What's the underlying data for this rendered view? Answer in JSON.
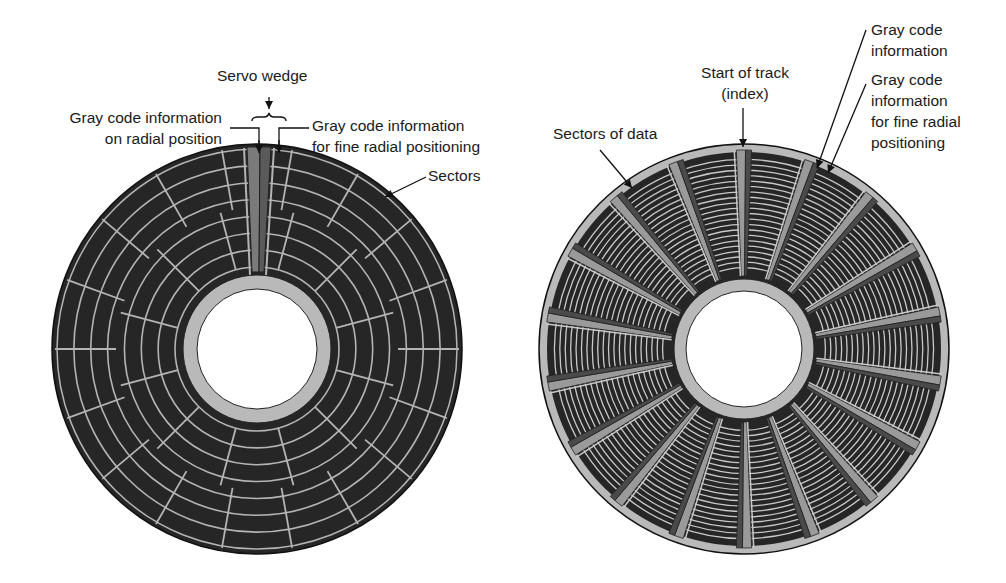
{
  "left_figure": {
    "title": "Servo wedge",
    "labels": {
      "servo_wedge": "Servo wedge",
      "gray_radial_1": "Gray code information",
      "gray_radial_2": "on radial position",
      "gray_fine_1": "Gray code information",
      "gray_fine_2": "for fine radial positioning",
      "sectors": "Sectors"
    },
    "disc": {
      "cx": 257,
      "cy": 349,
      "r_outer": 205,
      "r_hub": 74,
      "r_hole": 60,
      "tracks": 7,
      "sector_boundaries_per_zone": [
        24,
        12
      ]
    }
  },
  "right_figure": {
    "labels": {
      "start_track_1": "Start of track",
      "start_track_2": "(index)",
      "sectors_of_data": "Sectors of data",
      "gray_info_1": "Gray code",
      "gray_info_2": "information",
      "gray_fine_1": "Gray code",
      "gray_fine_2": "information",
      "gray_fine_3": "for fine radial",
      "gray_fine_4": "positioning"
    },
    "disc": {
      "cx": 744,
      "cy": 349,
      "r_outer": 205,
      "r_hub": 70,
      "r_hole": 58,
      "servo_wedges": 18,
      "tracks": 22
    }
  },
  "colors": {
    "dark": "#262626",
    "line": "#b4b4b4",
    "gray": "#8a8a8a",
    "hub": "#b9b9b9",
    "ink": "#111111"
  }
}
